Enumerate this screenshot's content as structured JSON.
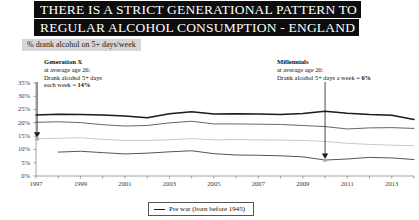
{
  "header": {
    "title_line1": "THERE IS A STRICT GENERATIONAL PATTERN TO",
    "title_line2": "REGULAR ALCOHOL CONSUMPTION - ENGLAND",
    "subtitle": "% drank alcohol on 5+ days/week"
  },
  "annotations": {
    "genx": {
      "heading": "Generation X",
      "line1": "at average age 26:",
      "line2": "Drank alcohol 5+ days",
      "line3_pre": "each week = ",
      "line3_value": "14%",
      "target_year": 1997,
      "target_value": 14
    },
    "millennials": {
      "heading": "Millennials",
      "line1": "at average age 26:",
      "line2_pre": "Drank alcohol 5+ days a week = ",
      "line2_value": "6%",
      "target_year": 2010,
      "target_value": 6
    }
  },
  "legend": {
    "position": "bottom-center",
    "entries": [
      {
        "label": "Pre war (born before 1945)",
        "color": "#1b1b1b"
      }
    ]
  },
  "chart_data": {
    "type": "line",
    "title": "THERE IS A STRICT GENERATIONAL PATTERN TO REGULAR ALCOHOL CONSUMPTION - ENGLAND",
    "subtitle": "% drank alcohol on 5+ days/week",
    "xlabel": "",
    "ylabel": "% drank alcohol on 5+ days/week",
    "grid": false,
    "legend_position": "bottom-center",
    "x": [
      1997,
      1998,
      1999,
      2000,
      2001,
      2002,
      2003,
      2004,
      2005,
      2006,
      2007,
      2008,
      2009,
      2010,
      2011,
      2012,
      2013,
      2014
    ],
    "xlim": [
      1997,
      2014
    ],
    "xtick_labels": [
      "1997",
      "1999",
      "2001",
      "2003",
      "2005",
      "2007",
      "2009",
      "2011",
      "2013"
    ],
    "xticks": [
      1997,
      1999,
      2001,
      2003,
      2005,
      2007,
      2009,
      2011,
      2013
    ],
    "ylim": [
      0,
      35
    ],
    "yticks": [
      0,
      5,
      10,
      15,
      20,
      25,
      30,
      35
    ],
    "ytick_labels": [
      "0%",
      "5%",
      "10%",
      "15%",
      "20%",
      "25%",
      "30%",
      "35%"
    ],
    "series": [
      {
        "name": "Pre war (born before 1945)",
        "color": "#1b1b1b",
        "values": [
          23.0,
          23.2,
          23.1,
          23.0,
          22.6,
          21.9,
          23.4,
          24.2,
          23.3,
          23.4,
          23.3,
          23.1,
          23.5,
          24.4,
          23.6,
          23.1,
          22.9,
          21.3
        ]
      },
      {
        "name": "Baby boomers",
        "color": "#666666",
        "values": [
          20.2,
          20.4,
          20.1,
          19.3,
          18.8,
          19.0,
          20.0,
          20.6,
          19.6,
          19.6,
          19.5,
          19.4,
          19.0,
          18.6,
          17.7,
          18.1,
          18.2,
          17.9
        ]
      },
      {
        "name": "Generation X",
        "color": "#c2c2c2",
        "values": [
          14.0,
          14.2,
          14.4,
          13.8,
          13.4,
          13.4,
          13.6,
          14.1,
          13.6,
          13.7,
          13.6,
          13.5,
          13.4,
          13.0,
          12.3,
          11.9,
          11.6,
          11.4
        ]
      },
      {
        "name": "Millennials",
        "color": "#555555",
        "values": [
          null,
          9.0,
          9.3,
          8.8,
          8.3,
          8.6,
          9.1,
          9.5,
          8.4,
          7.9,
          7.8,
          7.6,
          7.2,
          6.0,
          6.4,
          7.0,
          6.8,
          6.2
        ]
      }
    ]
  }
}
